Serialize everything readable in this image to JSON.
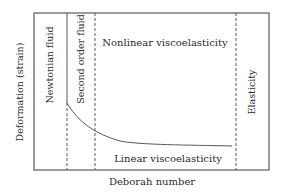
{
  "diagram": {
    "type": "regime-diagram",
    "xlabel": "Deborah number",
    "ylabel": "Deformation (strain)",
    "regions": {
      "newtonian": "Newtonian fluid",
      "second_order": "Second order fluid",
      "nonlinear": "Nonlinear viscoelasticity",
      "linear": "Linear viscoelasticity",
      "elasticity": "Elasticity"
    },
    "colors": {
      "line": "#5a5a5a",
      "text": "#2b2b2b",
      "background": "#ffffff"
    }
  }
}
